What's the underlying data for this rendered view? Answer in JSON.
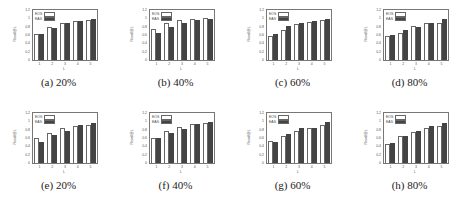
{
  "figure": {
    "panels": [
      {
        "caption": "(a) 20%"
      },
      {
        "caption": "(b) 40%"
      },
      {
        "caption": "(c) 60%"
      },
      {
        "caption": "(d) 80%"
      },
      {
        "caption": "(e) 20%"
      },
      {
        "caption": "(f) 40%"
      },
      {
        "caption": "(g) 60%"
      },
      {
        "caption": "(h) 80%"
      }
    ]
  },
  "chart_data": [
    {
      "type": "bar",
      "title": "(a) 20%",
      "xlabel": "L",
      "ylabel": "Recall@L",
      "categories": [
        "1",
        "2",
        "3",
        "4",
        "5"
      ],
      "ylim": [
        0,
        1.2
      ],
      "yticks": [
        "0",
        "0.2",
        "0.4",
        "0.6",
        "0.8",
        "1",
        "1.2"
      ],
      "legend_position": "upper left",
      "series": [
        {
          "name": "EOS",
          "values": [
            0.62,
            0.8,
            0.89,
            0.94,
            0.96
          ]
        },
        {
          "name": "EAS",
          "values": [
            0.62,
            0.78,
            0.88,
            0.94,
            0.98
          ]
        }
      ]
    },
    {
      "type": "bar",
      "title": "(b) 40%",
      "xlabel": "L",
      "ylabel": "Recall@L",
      "categories": [
        "1",
        "2",
        "3",
        "4",
        "5"
      ],
      "ylim": [
        0,
        1.2
      ],
      "yticks": [
        "0",
        "0.2",
        "0.4",
        "0.6",
        "0.8",
        "1",
        "1.2"
      ],
      "legend_position": "upper left",
      "series": [
        {
          "name": "EOS",
          "values": [
            0.75,
            0.9,
            0.97,
            0.99,
            1.0
          ]
        },
        {
          "name": "EAS",
          "values": [
            0.65,
            0.8,
            0.88,
            0.96,
            0.99
          ]
        }
      ]
    },
    {
      "type": "bar",
      "title": "(c) 60%",
      "xlabel": "L",
      "ylabel": "Recall@L",
      "categories": [
        "1",
        "2",
        "3",
        "4",
        "5"
      ],
      "ylim": [
        0,
        1.2
      ],
      "yticks": [
        "0",
        "0.2",
        "0.4",
        "0.6",
        "0.8",
        "1",
        "1.2"
      ],
      "legend_position": "upper left",
      "series": [
        {
          "name": "EOS",
          "values": [
            0.58,
            0.72,
            0.87,
            0.91,
            0.95
          ]
        },
        {
          "name": "EAS",
          "values": [
            0.63,
            0.81,
            0.9,
            0.94,
            0.98
          ]
        }
      ]
    },
    {
      "type": "bar",
      "title": "(d) 80%",
      "xlabel": "L",
      "ylabel": "Recall@L",
      "categories": [
        "1",
        "2",
        "3",
        "4",
        "5"
      ],
      "ylim": [
        0,
        1.2
      ],
      "yticks": [
        "0",
        "0.2",
        "0.4",
        "0.6",
        "0.8",
        "1",
        "1.2"
      ],
      "legend_position": "upper left",
      "series": [
        {
          "name": "EOS",
          "values": [
            0.57,
            0.66,
            0.82,
            0.88,
            0.89
          ]
        },
        {
          "name": "EAS",
          "values": [
            0.61,
            0.73,
            0.79,
            0.9,
            0.98
          ]
        }
      ]
    },
    {
      "type": "bar",
      "title": "(e) 20%",
      "xlabel": "L",
      "ylabel": "Recall@L",
      "categories": [
        "1",
        "2",
        "3",
        "4",
        "5"
      ],
      "ylim": [
        0,
        1.2
      ],
      "yticks": [
        "0",
        "0.2",
        "0.4",
        "0.6",
        "0.8",
        "1",
        "1.2"
      ],
      "legend_position": "upper left",
      "series": [
        {
          "name": "EOS",
          "values": [
            0.61,
            0.72,
            0.84,
            0.9,
            0.92
          ]
        },
        {
          "name": "EAS",
          "values": [
            0.5,
            0.68,
            0.78,
            0.91,
            0.96
          ]
        }
      ]
    },
    {
      "type": "bar",
      "title": "(f) 40%",
      "xlabel": "L",
      "ylabel": "Recall@L",
      "categories": [
        "1",
        "2",
        "3",
        "4",
        "5"
      ],
      "ylim": [
        0,
        1.2
      ],
      "yticks": [
        "0",
        "0.2",
        "0.4",
        "0.6",
        "0.8",
        "1",
        "1.2"
      ],
      "legend_position": "upper left",
      "series": [
        {
          "name": "EOS",
          "values": [
            0.61,
            0.76,
            0.87,
            0.94,
            0.97
          ]
        },
        {
          "name": "EAS",
          "values": [
            0.59,
            0.71,
            0.82,
            0.94,
            0.98
          ]
        }
      ]
    },
    {
      "type": "bar",
      "title": "(g) 60%",
      "xlabel": "L",
      "ylabel": "Recall@L",
      "categories": [
        "1",
        "2",
        "3",
        "4",
        "5"
      ],
      "ylim": [
        0,
        1.2
      ],
      "yticks": [
        "0",
        "0.2",
        "0.4",
        "0.6",
        "0.8",
        "1",
        "1.2"
      ],
      "legend_position": "upper left",
      "series": [
        {
          "name": "EOS",
          "values": [
            0.52,
            0.66,
            0.77,
            0.85,
            0.92
          ]
        },
        {
          "name": "EAS",
          "values": [
            0.5,
            0.7,
            0.85,
            0.85,
            0.98
          ]
        }
      ]
    },
    {
      "type": "bar",
      "title": "(h) 80%",
      "xlabel": "L",
      "ylabel": "Recall@L",
      "categories": [
        "1",
        "2",
        "3",
        "4",
        "5"
      ],
      "ylim": [
        0,
        1.2
      ],
      "yticks": [
        "0",
        "0.2",
        "0.4",
        "0.6",
        "0.8",
        "1",
        "1.2"
      ],
      "legend_position": "upper left",
      "series": [
        {
          "name": "EOS",
          "values": [
            0.46,
            0.66,
            0.74,
            0.84,
            0.89
          ]
        },
        {
          "name": "EAS",
          "values": [
            0.49,
            0.66,
            0.78,
            0.88,
            0.96
          ]
        }
      ]
    }
  ]
}
